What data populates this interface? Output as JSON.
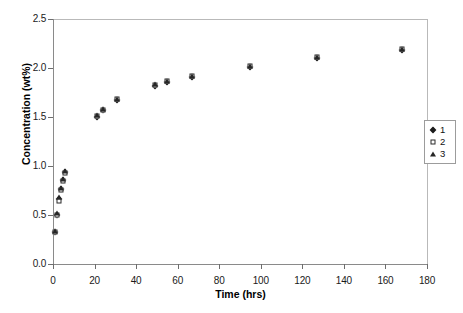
{
  "chart_data": {
    "type": "scatter",
    "title": "",
    "xlabel": "Time (hrs)",
    "ylabel": "Concentration (wt%)",
    "xlim": [
      0,
      180
    ],
    "ylim": [
      0,
      2.5
    ],
    "xticks": [
      0,
      20,
      40,
      60,
      80,
      100,
      120,
      140,
      160,
      180
    ],
    "yticks": [
      "0.0",
      "0.5",
      "1.0",
      "1.5",
      "2.0",
      "2.5"
    ],
    "grid": false,
    "legend_position": "right-outside",
    "x": [
      1,
      2,
      3,
      4,
      5,
      6,
      21,
      24,
      31,
      49,
      55,
      67,
      95,
      127,
      168
    ],
    "series": [
      {
        "name": "1",
        "marker": "filled-diamond",
        "color": "#1c1c1c",
        "values": [
          0.33,
          0.5,
          0.66,
          0.77,
          0.86,
          0.94,
          1.5,
          1.57,
          1.67,
          1.82,
          1.86,
          1.91,
          2.01,
          2.1,
          2.18
        ]
      },
      {
        "name": "2",
        "marker": "open-square",
        "color": "#2b2b2b",
        "values": [
          0.33,
          0.5,
          0.64,
          0.76,
          0.85,
          0.93,
          1.51,
          1.57,
          1.68,
          1.83,
          1.87,
          1.92,
          2.02,
          2.11,
          2.19
        ]
      },
      {
        "name": "3",
        "marker": "filled-triangle",
        "color": "#262626",
        "values": [
          0.34,
          0.52,
          0.68,
          0.78,
          0.87,
          0.95,
          1.52,
          1.58,
          1.68,
          1.84,
          1.87,
          1.92,
          2.02,
          2.11,
          2.19
        ]
      }
    ]
  },
  "legend": {
    "items": [
      {
        "label": "1",
        "marker": "filled-diamond"
      },
      {
        "label": "2",
        "marker": "open-square"
      },
      {
        "label": "3",
        "marker": "filled-triangle"
      }
    ]
  },
  "axes": {
    "x_title": "Time (hrs)",
    "y_title": "Concentration (wt%)"
  }
}
